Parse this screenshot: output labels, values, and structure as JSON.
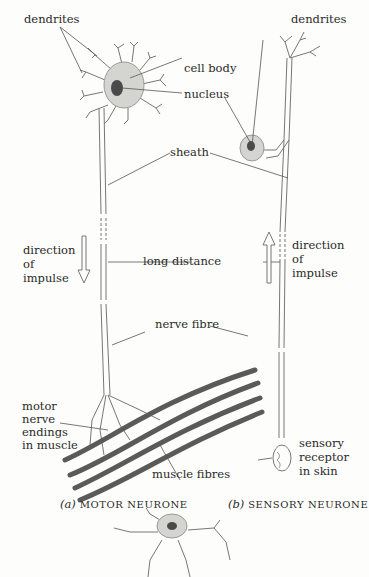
{
  "diagram": {
    "motor_neurone": {
      "caption_letter": "(a)",
      "caption_text": "MOTOR NEURONE",
      "labels": {
        "dendrites": "dendrites",
        "cell_body": "cell body",
        "nucleus": "nucleus",
        "direction_line1": "direction",
        "direction_line2": "of",
        "direction_line3": "impulse",
        "motor_endings_line1": "motor",
        "motor_endings_line2": "nerve",
        "motor_endings_line3": "endings",
        "motor_endings_line4": "in muscle",
        "muscle_fibres": "muscle fibres"
      },
      "impulse_arrow": "down"
    },
    "sensory_neurone": {
      "caption_letter": "(b)",
      "caption_text": "SENSORY NEURONE",
      "labels": {
        "dendrites": "dendrites",
        "direction_line1": "direction",
        "direction_line2": "of",
        "direction_line3": "impulse",
        "receptor_line1": "sensory",
        "receptor_line2": "receptor",
        "receptor_line3": "in skin"
      },
      "impulse_arrow": "up"
    },
    "shared_labels": {
      "sheath": "sheath",
      "long_distance": "long distance",
      "nerve_fibre": "nerve fibre"
    },
    "colors": {
      "cell_fill": "#d4d4d0",
      "nucleus_fill": "#4a4a4a",
      "muscle_fibre": "#5a5a5a",
      "line": "#555555"
    }
  }
}
